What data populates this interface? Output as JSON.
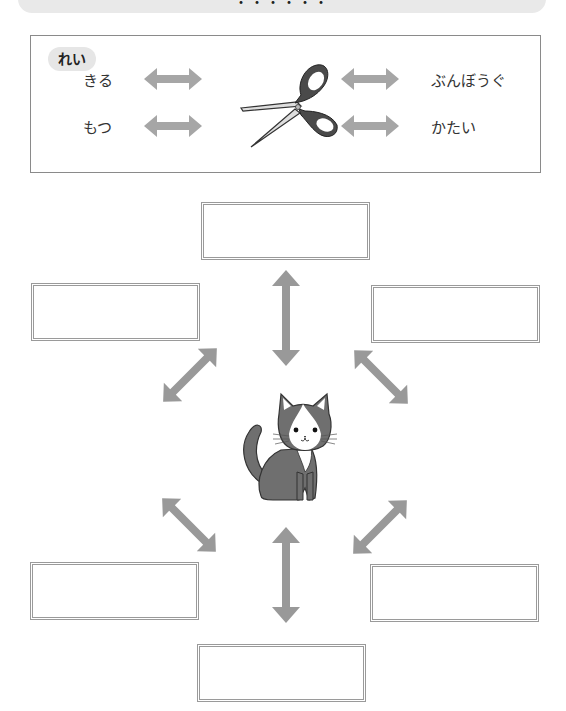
{
  "header": {
    "title": "・・・・・・"
  },
  "example": {
    "badge_label": "れい",
    "center_icon": "scissors-icon",
    "left_words": [
      "きる",
      "もつ"
    ],
    "right_words": [
      "ぶんぼうぐ",
      "かたい"
    ]
  },
  "diagram": {
    "center_icon": "cat-illustration",
    "answer_boxes": [
      {
        "position": "top",
        "value": ""
      },
      {
        "position": "upper-left",
        "value": ""
      },
      {
        "position": "upper-right",
        "value": ""
      },
      {
        "position": "lower-left",
        "value": ""
      },
      {
        "position": "lower-right",
        "value": ""
      },
      {
        "position": "bottom",
        "value": ""
      }
    ]
  },
  "colors": {
    "arrow": "#999999",
    "box_border": "#9a9a9a",
    "badge_bg": "#e6e6e6",
    "header_bg": "#e9e9e9",
    "cat_body": "#6f6f6f",
    "scissors_handle": "#4a4a4a"
  }
}
